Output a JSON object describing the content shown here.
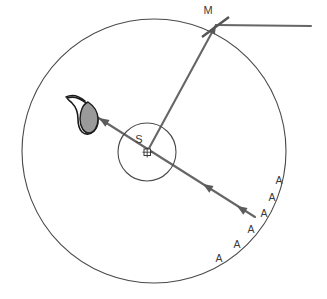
{
  "figure": {
    "width": 327,
    "height": 299,
    "background_color": "#ffffff"
  },
  "colors": {
    "outline": "#4a4a4a",
    "ray": "#666666",
    "mirror": "#555555",
    "eye_fill": "#999999",
    "eye_outline": "#1a1a1a",
    "text": "#3b3b3b"
  },
  "labels": {
    "source": "S",
    "mirror": "M",
    "aperture_marks": [
      {
        "text": "A",
        "x": 279,
        "y": 184
      },
      {
        "text": "A",
        "x": 272,
        "y": 201
      },
      {
        "text": "A",
        "x": 264,
        "y": 217
      },
      {
        "text": "A",
        "x": 251,
        "y": 233
      },
      {
        "text": "A",
        "x": 237,
        "y": 248
      },
      {
        "text": "A",
        "x": 219,
        "y": 262
      }
    ]
  },
  "shapes": {
    "outer_circle": {
      "name": "outer-circle",
      "cx": 154,
      "cy": 151,
      "r": 132
    },
    "inner_circle": {
      "name": "source-circle",
      "cx": 147,
      "cy": 152,
      "r": 29
    },
    "source_marker": {
      "name": "source-marker",
      "cx": 147,
      "cy": 152,
      "size": 6
    },
    "main_ray": {
      "name": "incoming-ray",
      "x1": 255,
      "y1": 217,
      "x2": 95,
      "y2": 116
    },
    "mirror_ray": {
      "name": "mirror-ray",
      "x1": 147,
      "y1": 152,
      "x2": 215,
      "y2": 22
    },
    "mirror_surface": {
      "name": "mirror-surface",
      "x1": 203,
      "y1": 36,
      "x2": 228,
      "y2": 18
    },
    "horizontal_ray": {
      "name": "horizontal-ray",
      "x1": 216,
      "y1": 25,
      "x2": 311,
      "y2": 26
    },
    "eye": {
      "name": "observer-eye",
      "cx": 88,
      "cy": 113
    }
  },
  "arrowheads": [
    {
      "name": "arrowhead-to-eye",
      "x": 101,
      "y": 120,
      "angle": -147.7
    },
    {
      "name": "arrowhead-mid-ray",
      "x": 203,
      "y": 185,
      "angle": -147.7
    },
    {
      "name": "arrowhead-lower-ray",
      "x": 236,
      "y": 206,
      "angle": -147.7
    },
    {
      "name": "arrowhead-mirror",
      "x": 216,
      "y": 25,
      "angle": -152.0
    }
  ]
}
